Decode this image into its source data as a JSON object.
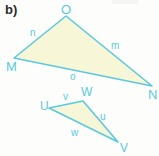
{
  "figure": {
    "part_label": "b)",
    "background_color": "#fdfdfb",
    "stroke_color": "#5bc8e0",
    "fill_color": "#f7f7d8",
    "label_color": "#5bc8e0",
    "part_label_color": "#2b2b2b",
    "width": 159,
    "height": 156
  },
  "triangles": [
    {
      "name": "triangle-MNO",
      "vertices": [
        {
          "id": "O",
          "label": "O",
          "x": 66,
          "y": 16,
          "label_x": 61,
          "label_y": 3
        },
        {
          "id": "N",
          "label": "N",
          "x": 152,
          "y": 86,
          "label_x": 148,
          "label_y": 88
        },
        {
          "id": "M",
          "label": "M",
          "x": 14,
          "y": 58,
          "label_x": 6,
          "label_y": 60
        }
      ],
      "sides": [
        {
          "id": "n",
          "label": "n",
          "between": "M-O",
          "label_x": 30,
          "label_y": 28
        },
        {
          "id": "m",
          "label": "m",
          "between": "O-N",
          "label_x": 111,
          "label_y": 41
        },
        {
          "id": "o",
          "label": "o",
          "between": "M-N",
          "label_x": 70,
          "label_y": 72
        }
      ]
    },
    {
      "name": "triangle-UVW",
      "vertices": [
        {
          "id": "W",
          "label": "W",
          "x": 83,
          "y": 101,
          "label_x": 81,
          "label_y": 86
        },
        {
          "id": "V",
          "label": "V",
          "x": 118,
          "y": 142,
          "label_x": 120,
          "label_y": 142
        },
        {
          "id": "U",
          "label": "U",
          "x": 49,
          "y": 108,
          "label_x": 40,
          "label_y": 100
        }
      ],
      "sides": [
        {
          "id": "v",
          "label": "v",
          "between": "U-W",
          "label_x": 63,
          "label_y": 92
        },
        {
          "id": "u",
          "label": "u",
          "between": "W-V",
          "label_x": 100,
          "label_y": 112
        },
        {
          "id": "w",
          "label": "w",
          "between": "U-V",
          "label_x": 71,
          "label_y": 128
        }
      ]
    }
  ]
}
